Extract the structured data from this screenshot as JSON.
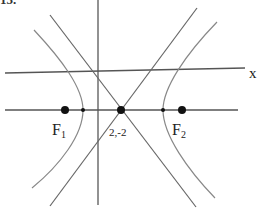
{
  "diagram": {
    "problem_number": "15.",
    "axis_label_x": "x",
    "foci": [
      {
        "name": "F",
        "subscript": "1",
        "x": 65,
        "y": 110
      },
      {
        "name": "F",
        "subscript": "2",
        "x": 182,
        "y": 110
      }
    ],
    "vertices": [
      {
        "x": 83,
        "y": 110
      },
      {
        "x": 163,
        "y": 110
      }
    ],
    "center": {
      "label": "2,-2",
      "x": 121,
      "y": 110
    },
    "colors": {
      "line": "#6a6a6a",
      "curve": "#8a8a8a",
      "point": "#111111",
      "text": "#222222"
    }
  }
}
